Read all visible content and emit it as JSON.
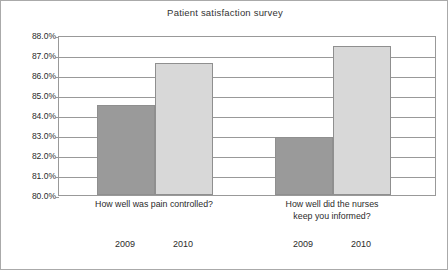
{
  "chart_data": {
    "type": "bar",
    "title": "Patient satisfaction survey",
    "xlabel": "",
    "ylabel": "",
    "ylim": [
      80.0,
      88.0
    ],
    "ytick_labels": [
      "88.0%",
      "87.0%",
      "86.0%",
      "85.0%",
      "84.0%",
      "83.0%",
      "82.0%",
      "81.0%",
      "80.0%"
    ],
    "ytick_values": [
      88.0,
      87.0,
      86.0,
      85.0,
      84.0,
      83.0,
      82.0,
      81.0,
      80.0
    ],
    "grid": true,
    "legend": "none",
    "categories": [
      "How well was pain controlled?",
      "How well did the nurses keep you informed?"
    ],
    "series": [
      {
        "name": "2009",
        "values": [
          84.5,
          82.9
        ],
        "color": "#9a9a9a"
      },
      {
        "name": "2010",
        "values": [
          86.6,
          87.45
        ],
        "color": "#d8d8d8"
      }
    ],
    "bars": [
      {
        "group": 0,
        "series": "2009",
        "value": 84.5,
        "label": "2009",
        "color": "#9a9a9a"
      },
      {
        "group": 0,
        "series": "2010",
        "value": 86.6,
        "label": "2010",
        "color": "#d8d8d8"
      },
      {
        "group": 1,
        "series": "2009",
        "value": 82.9,
        "label": "2009",
        "color": "#9a9a9a"
      },
      {
        "group": 1,
        "series": "2010",
        "value": 87.45,
        "label": "2010",
        "color": "#d8d8d8"
      }
    ],
    "category_label_lines": [
      [
        "How well was pain controlled?"
      ],
      [
        "How well did the nurses",
        "keep you informed?"
      ]
    ],
    "year_labels": [
      "2009",
      "2010",
      "2009",
      "2010"
    ]
  },
  "colors": {
    "series_2009": "#9a9a9a",
    "series_2010": "#d8d8d8",
    "axis": "#999999",
    "text": "#2b2b2b",
    "background": "#ffffff"
  }
}
